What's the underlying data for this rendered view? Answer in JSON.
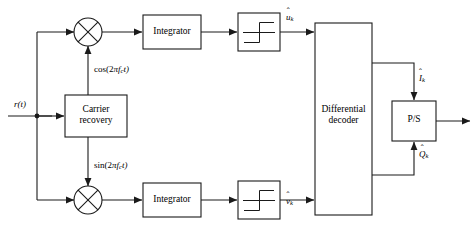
{
  "diagram": {
    "canvas": {
      "width": 476,
      "height": 227
    },
    "colors": {
      "line": "#1a1a1a",
      "background": "#ffffff",
      "text": "#000000"
    },
    "blocks": [
      {
        "id": "carrier_recovery",
        "label_line1": "Carrier",
        "label_line2": "recovery"
      },
      {
        "id": "integrator_top",
        "label_line1": "Integrator",
        "label_line2": ""
      },
      {
        "id": "integrator_bot",
        "label_line1": "Integrator",
        "label_line2": ""
      },
      {
        "id": "decision_top",
        "label_line1": "",
        "label_line2": "",
        "symbol": "step-function"
      },
      {
        "id": "decision_bot",
        "label_line1": "",
        "label_line2": "",
        "symbol": "step-function"
      },
      {
        "id": "differential_decoder",
        "label_line1": "Differential",
        "label_line2": "decoder"
      },
      {
        "id": "parallel_to_serial",
        "label_line1": "P/S",
        "label_line2": ""
      }
    ],
    "mixers": [
      {
        "id": "mixer_top",
        "symbol": "multiply-x"
      },
      {
        "id": "mixer_bot",
        "symbol": "multiply-x"
      }
    ],
    "signal_labels": {
      "input": {
        "text": "r(t)"
      },
      "carrier_cos": {
        "text": "cos(2πfₓt)",
        "prefix": "cos(2",
        "pi": "π",
        "freq": "f",
        "sub": "c",
        "suffix": "t)"
      },
      "carrier_sin": {
        "text": "sin(2πfₓt)",
        "prefix": "sin(2",
        "pi": "π",
        "freq": "f",
        "sub": "c",
        "suffix": "t)"
      },
      "decision_out_top": {
        "base": "u",
        "hat": "ˆ",
        "sub": "k"
      },
      "decision_out_bot": {
        "base": "v",
        "hat": "ˆ",
        "sub": "k"
      },
      "decoder_out_i": {
        "base": "I",
        "hat": "ˆ",
        "sub": "k"
      },
      "decoder_out_q": {
        "base": "Q",
        "hat": "ˆ",
        "sub": "k"
      }
    }
  }
}
